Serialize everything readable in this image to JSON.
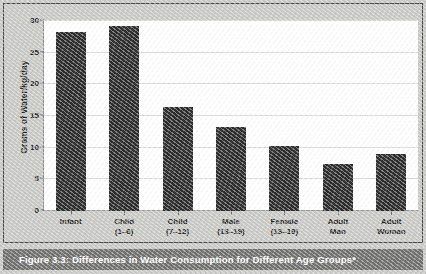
{
  "caption": {
    "text": "Figure 3.3: Differences in Water Consumption for Different Age Groups*"
  },
  "colors": {
    "bar": "#2b2b2b",
    "caption_bar": "#6f6f6e",
    "page_background": "#c9c9c6",
    "plot_background": "#ffffff",
    "gridline": "#d8d8d8"
  },
  "chart_data": {
    "type": "bar",
    "title": "",
    "subtitle": "",
    "xlabel": "",
    "ylabel": "Grams of Water/kg/day",
    "categories": [
      "Infant",
      "Child (1–6)",
      "Child (7–12)",
      "Male (13–19)",
      "Female (13–19)",
      "Adult Man",
      "Adult Woman"
    ],
    "category_lines": [
      [
        "Infant",
        ""
      ],
      [
        "Child",
        "(1–6)"
      ],
      [
        "Child",
        "(7–12)"
      ],
      [
        "Male",
        "(13–19)"
      ],
      [
        "Female",
        "(13–19)"
      ],
      [
        "Adult",
        "Man"
      ],
      [
        "Adult",
        "Woman"
      ]
    ],
    "values": [
      28.2,
      29.2,
      16.4,
      13.3,
      10.2,
      7.5,
      9.0
    ],
    "ylim": [
      0,
      30
    ],
    "yticks": [
      0,
      5,
      10,
      15,
      20,
      25,
      30
    ],
    "ytick_labels": [
      "0",
      "5",
      "10",
      "15",
      "20",
      "25",
      "30"
    ],
    "grid": true,
    "legend": "none"
  }
}
